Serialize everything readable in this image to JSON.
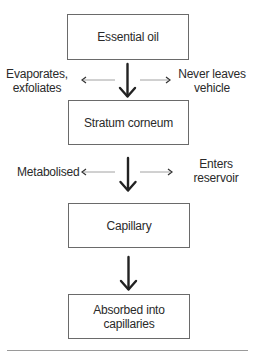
{
  "diagram": {
    "nodes": [
      {
        "id": "essential-oil",
        "label": "Essential oil"
      },
      {
        "id": "stratum-corneum",
        "label": "Stratum corneum"
      },
      {
        "id": "capillary",
        "label": "Capillary"
      },
      {
        "id": "absorbed",
        "label": "Absorbed into capillaries"
      }
    ],
    "side_paths": {
      "step1_left": {
        "line1": "Evaporates,",
        "line2": "exfoliates"
      },
      "step1_right": {
        "line1": "Never leaves",
        "line2": "vehicle"
      },
      "step2_left": {
        "line1": "Metabolised"
      },
      "step2_right": {
        "line1": "Enters",
        "line2": "reservoir"
      }
    },
    "edges": [
      {
        "from": "essential-oil",
        "to": "stratum-corneum",
        "type": "main"
      },
      {
        "from": "essential-oil",
        "to": "step1_left",
        "type": "side"
      },
      {
        "from": "essential-oil",
        "to": "step1_right",
        "type": "side"
      },
      {
        "from": "stratum-corneum",
        "to": "capillary",
        "type": "main"
      },
      {
        "from": "stratum-corneum",
        "to": "step2_left",
        "type": "side"
      },
      {
        "from": "stratum-corneum",
        "to": "step2_right",
        "type": "side"
      },
      {
        "from": "capillary",
        "to": "absorbed",
        "type": "main"
      }
    ],
    "colors": {
      "box_border": "#6a6a6a",
      "main_arrow": "#222222",
      "side_arrow": "#8a8a8a",
      "text": "#2a2a2a"
    }
  }
}
